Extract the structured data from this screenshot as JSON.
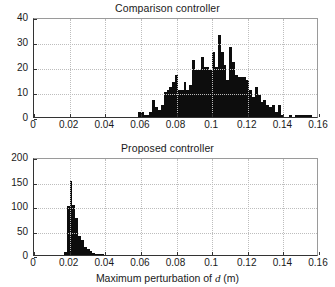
{
  "figure": {
    "background": "#ffffff",
    "bar_color": "#0d0d0d",
    "grid_color": "#bdbdbd",
    "axis_color": "#333333",
    "xaxis_caption_prefix": "Maximum perturbation of ",
    "xaxis_caption_symbol": "d",
    "xaxis_caption_suffix": " (m)"
  },
  "chart_data": [
    {
      "type": "bar",
      "id": "comparison-controller",
      "title": "Comparison controller",
      "xlabel": "Maximum perturbation of d (m)",
      "ylabel": "",
      "xlim": [
        0,
        0.16
      ],
      "ylim": [
        0,
        40
      ],
      "xticks": [
        0,
        0.02,
        0.04,
        0.06,
        0.08,
        0.1,
        0.12,
        0.14,
        0.16
      ],
      "xticklabels": [
        "0",
        "0.02",
        "0.04",
        "0.06",
        "0.08",
        "0.1",
        "0.12",
        "0.14",
        "0.16"
      ],
      "yticks": [
        0,
        10,
        20,
        30,
        40
      ],
      "yticklabels": [
        "0",
        "10",
        "20",
        "30",
        "40"
      ],
      "grid": true,
      "legend": null,
      "bin_width": 0.0016,
      "x": [
        0.0592,
        0.0608,
        0.0624,
        0.064,
        0.0656,
        0.0672,
        0.0688,
        0.0704,
        0.072,
        0.0736,
        0.0752,
        0.0768,
        0.0784,
        0.08,
        0.0816,
        0.0832,
        0.0848,
        0.0864,
        0.088,
        0.0896,
        0.0912,
        0.0928,
        0.0944,
        0.096,
        0.0976,
        0.0992,
        0.1008,
        0.1024,
        0.104,
        0.1056,
        0.1072,
        0.1088,
        0.1104,
        0.112,
        0.1136,
        0.1152,
        0.1168,
        0.1184,
        0.12,
        0.1216,
        0.1232,
        0.1248,
        0.1264,
        0.128,
        0.1296,
        0.1312,
        0.1328,
        0.1344,
        0.136,
        0.1376,
        0.1392,
        0.1408,
        0.1424,
        0.144,
        0.1456,
        0.1472,
        0.1488,
        0.1504,
        0.152,
        0.1536,
        0.1552
      ],
      "values": [
        2,
        2,
        1,
        1,
        2,
        7,
        4,
        3,
        5,
        10,
        11,
        12,
        14,
        17,
        11,
        11,
        14,
        11,
        13,
        23,
        19,
        19,
        24,
        20,
        20,
        19,
        26,
        20,
        33,
        26,
        21,
        15,
        28,
        22,
        17,
        16,
        16,
        16,
        15,
        11,
        8,
        12,
        9,
        6,
        7,
        5,
        4,
        5,
        2,
        5,
        1,
        0,
        0,
        1,
        0,
        1,
        1,
        1,
        1,
        1,
        1
      ]
    },
    {
      "type": "bar",
      "id": "proposed-controller",
      "title": "Proposed controller",
      "xlabel": "Maximum perturbation of d (m)",
      "ylabel": "",
      "xlim": [
        0,
        0.16
      ],
      "ylim": [
        0,
        200
      ],
      "xticks": [
        0,
        0.02,
        0.04,
        0.06,
        0.08,
        0.1,
        0.12,
        0.14,
        0.16
      ],
      "xticklabels": [
        "0",
        "0.02",
        "0.04",
        "0.06",
        "0.08",
        "0.1",
        "0.12",
        "0.14",
        "0.16"
      ],
      "yticks": [
        0,
        50,
        100,
        150,
        200
      ],
      "yticklabels": [
        "0",
        "50",
        "100",
        "150",
        "200"
      ],
      "grid": true,
      "legend": null,
      "bin_width": 0.0016,
      "x": [
        0.0176,
        0.0192,
        0.0208,
        0.0224,
        0.024,
        0.0256,
        0.0272,
        0.0288,
        0.0304,
        0.032,
        0.0336,
        0.0352,
        0.0368,
        0.0384
      ],
      "values": [
        6,
        100,
        152,
        103,
        76,
        38,
        30,
        16,
        12,
        8,
        5,
        3,
        2,
        1
      ]
    }
  ]
}
